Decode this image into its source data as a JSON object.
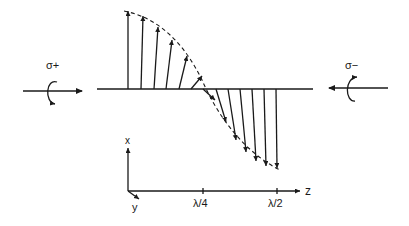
{
  "diagram": {
    "left_beam": {
      "label": "σ+",
      "direction": "right",
      "rotation": "counterclockwise-arrow-bottom"
    },
    "right_beam": {
      "label": "σ−",
      "direction": "left",
      "rotation": "arrow-top"
    },
    "axes": {
      "x_label": "x",
      "y_label": "y",
      "z_label": "z",
      "ticks": [
        {
          "label": "λ/4",
          "x": 203
        },
        {
          "label": "λ/2",
          "x": 277
        }
      ]
    },
    "field_vectors": {
      "up": [
        {
          "x": 128,
          "tip_x": 128,
          "tip_y": 11
        },
        {
          "x": 141,
          "tip_x": 143,
          "tip_y": 16
        },
        {
          "x": 154,
          "tip_x": 158,
          "tip_y": 27
        },
        {
          "x": 166,
          "tip_x": 172,
          "tip_y": 40
        },
        {
          "x": 179,
          "tip_x": 187,
          "tip_y": 56
        },
        {
          "x": 191,
          "tip_x": 202,
          "tip_y": 76
        }
      ],
      "down": [
        {
          "x": 205,
          "tip_x": 215,
          "tip_y": 100
        },
        {
          "x": 216,
          "tip_x": 226,
          "tip_y": 122
        },
        {
          "x": 228,
          "tip_x": 236,
          "tip_y": 140
        },
        {
          "x": 240,
          "tip_x": 246,
          "tip_y": 152
        },
        {
          "x": 252,
          "tip_x": 256,
          "tip_y": 161
        },
        {
          "x": 264,
          "tip_x": 266,
          "tip_y": 166
        },
        {
          "x": 276,
          "tip_x": 277,
          "tip_y": 168
        }
      ]
    }
  }
}
